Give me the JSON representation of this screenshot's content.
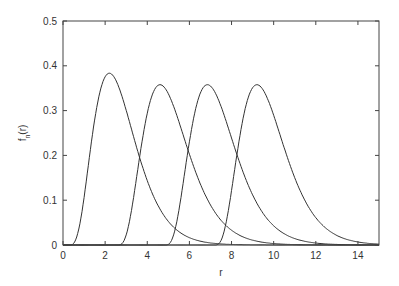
{
  "chart_data": {
    "type": "line",
    "title": "",
    "xlabel": "r",
    "ylabel": "f_n(r)",
    "xlim": [
      0,
      15
    ],
    "ylim": [
      0,
      0.5
    ],
    "grid": false,
    "legend": null,
    "x_ticks": [
      "0",
      "2",
      "4",
      "6",
      "8",
      "10",
      "12",
      "14"
    ],
    "y_ticks": [
      "0",
      "0.1",
      "0.2",
      "0.3",
      "0.4",
      "0.5"
    ],
    "series": [
      {
        "name": "n=1",
        "shift": 0.3,
        "shape": 4.5,
        "scale": 0.543,
        "peak_r": 2.2,
        "peak_f": 0.39
      },
      {
        "name": "n=2",
        "shift": 2.6,
        "shape": 4.4,
        "scale": 0.59,
        "peak_r": 4.6,
        "peak_f": 0.37
      },
      {
        "name": "n=3",
        "shift": 4.85,
        "shape": 4.4,
        "scale": 0.59,
        "peak_r": 6.85,
        "peak_f": 0.37
      },
      {
        "name": "n=4",
        "shift": 7.2,
        "shape": 4.4,
        "scale": 0.59,
        "peak_r": 9.2,
        "peak_f": 0.37
      }
    ],
    "line_color": "#333333"
  }
}
